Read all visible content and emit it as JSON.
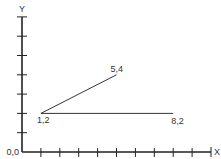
{
  "chart_data": {
    "type": "line",
    "title": "",
    "xlabel": "X",
    "ylabel": "Y",
    "origin_label": "0,0",
    "xlim": [
      0,
      10
    ],
    "ylim": [
      0,
      7
    ],
    "x_ticks": [
      1,
      2,
      3,
      4,
      5,
      6,
      7,
      8,
      9
    ],
    "y_ticks": [
      1,
      2,
      3,
      4,
      5,
      6,
      7
    ],
    "grid": false,
    "legend": null,
    "points": [
      {
        "x": 1,
        "y": 2,
        "label": "1,2"
      },
      {
        "x": 5,
        "y": 4,
        "label": "5,4"
      },
      {
        "x": 8,
        "y": 2,
        "label": "8,2"
      }
    ],
    "segments": [
      {
        "from": [
          1,
          2
        ],
        "to": [
          5,
          4
        ]
      },
      {
        "from": [
          1,
          2
        ],
        "to": [
          8,
          2
        ]
      }
    ]
  },
  "colors": {
    "axis": "#222222",
    "line": "#333333",
    "text": "#333333",
    "background": "#ffffff"
  }
}
